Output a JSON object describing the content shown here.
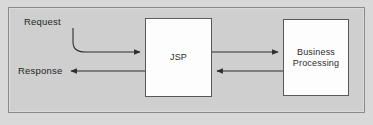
{
  "diagram": {
    "type": "flow-diagram",
    "background_color": "#cfcfcf",
    "box_fill_color": "#fdfdfd",
    "line_color": "#3a3a3a",
    "nodes": [
      {
        "id": "jsp",
        "label": "JSP"
      },
      {
        "id": "business",
        "label_line1": "Business",
        "label_line2": "Processing"
      }
    ],
    "labels": {
      "request": "Request",
      "response": "Response"
    },
    "edges": [
      {
        "id": "request-edge",
        "from": "request",
        "to": "jsp",
        "style": "curved",
        "direction": "right"
      },
      {
        "id": "response-edge",
        "from": "jsp",
        "to": "response",
        "style": "straight",
        "direction": "left"
      },
      {
        "id": "jsp-to-business-edge",
        "from": "jsp",
        "to": "business",
        "style": "straight",
        "direction": "right"
      },
      {
        "id": "business-to-jsp-edge",
        "from": "business",
        "to": "jsp",
        "style": "straight",
        "direction": "left"
      }
    ]
  }
}
